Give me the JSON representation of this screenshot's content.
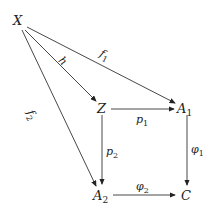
{
  "diagram": {
    "type": "commutative-diagram",
    "nodes": [
      {
        "id": "X",
        "label": "X",
        "x": 19,
        "y": 20
      },
      {
        "id": "Z",
        "label": "Z",
        "x": 102,
        "y": 108
      },
      {
        "id": "A1",
        "label": "A",
        "sub": "1",
        "x": 186,
        "y": 108
      },
      {
        "id": "A2",
        "label": "A",
        "sub": "2",
        "x": 102,
        "y": 195
      },
      {
        "id": "C",
        "label": "C",
        "x": 186,
        "y": 195
      }
    ],
    "edges": [
      {
        "from": "X",
        "to": "A1",
        "label": "f",
        "sub": "1"
      },
      {
        "from": "X",
        "to": "Z",
        "label": "h",
        "sub": ""
      },
      {
        "from": "X",
        "to": "A2",
        "label": "f",
        "sub": "2"
      },
      {
        "from": "Z",
        "to": "A1",
        "label": "p",
        "sub": "1"
      },
      {
        "from": "Z",
        "to": "A2",
        "label": "p",
        "sub": "2"
      },
      {
        "from": "A1",
        "to": "C",
        "label": "φ",
        "sub": "1"
      },
      {
        "from": "A2",
        "to": "C",
        "label": "φ",
        "sub": "2"
      }
    ]
  }
}
